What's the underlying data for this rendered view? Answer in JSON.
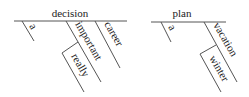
{
  "diagrams": [
    {
      "head": "decision",
      "modifiers": [
        {
          "word": "a"
        },
        {
          "word": "important",
          "modifier": "really"
        },
        {
          "word": "career"
        }
      ]
    },
    {
      "head": "plan",
      "modifiers": [
        {
          "word": "a"
        },
        {
          "word": "vacation",
          "modifier": "winter"
        }
      ]
    }
  ]
}
